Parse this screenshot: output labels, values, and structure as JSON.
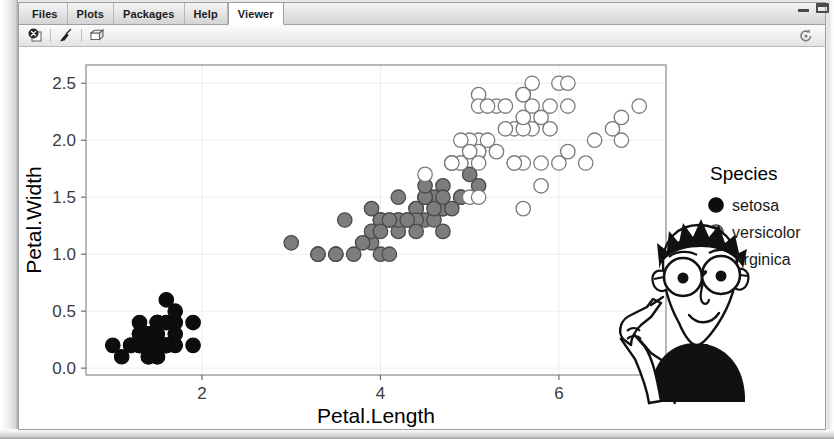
{
  "window": {
    "controls": [
      {
        "name": "minimize",
        "glyph": "minimize-icon"
      },
      {
        "name": "maximize",
        "glyph": "maximize-icon"
      }
    ]
  },
  "tabs": [
    {
      "label": "Files",
      "active": false
    },
    {
      "label": "Plots",
      "active": false
    },
    {
      "label": "Packages",
      "active": false
    },
    {
      "label": "Help",
      "active": false
    },
    {
      "label": "Viewer",
      "active": true
    }
  ],
  "toolbar": {
    "buttons": [
      {
        "name": "clear-viewer-icon",
        "title": "Back"
      },
      {
        "name": "broom-icon",
        "title": "Clear"
      },
      {
        "name": "publish-icon",
        "title": "Publish"
      }
    ],
    "refresh": {
      "name": "refresh-icon",
      "title": "Refresh"
    }
  },
  "chart_data": {
    "type": "scatter",
    "title": "",
    "xlabel": "Petal.Length",
    "ylabel": "Petal.Width",
    "xlim": [
      0.7,
      7.2
    ],
    "ylim": [
      -0.06,
      2.66
    ],
    "xticks": [
      2,
      4,
      6
    ],
    "xtick_labels": [
      "2",
      "4",
      "6"
    ],
    "yticks": [
      0.0,
      0.5,
      1.0,
      1.5,
      2.0,
      2.5
    ],
    "ytick_labels": [
      "0.0",
      "0.5",
      "1.0",
      "1.5",
      "2.0",
      "2.5"
    ],
    "grid": true,
    "legend_position": "right",
    "legend_title": "Species",
    "series": [
      {
        "name": "setosa",
        "fill": "#0d0d0d",
        "stroke": "#0d0d0d",
        "points": [
          [
            1.4,
            0.2
          ],
          [
            1.4,
            0.2
          ],
          [
            1.3,
            0.2
          ],
          [
            1.5,
            0.2
          ],
          [
            1.4,
            0.2
          ],
          [
            1.7,
            0.4
          ],
          [
            1.4,
            0.3
          ],
          [
            1.5,
            0.2
          ],
          [
            1.4,
            0.2
          ],
          [
            1.5,
            0.1
          ],
          [
            1.5,
            0.2
          ],
          [
            1.6,
            0.2
          ],
          [
            1.4,
            0.1
          ],
          [
            1.1,
            0.1
          ],
          [
            1.2,
            0.2
          ],
          [
            1.5,
            0.4
          ],
          [
            1.3,
            0.4
          ],
          [
            1.4,
            0.3
          ],
          [
            1.7,
            0.3
          ],
          [
            1.5,
            0.3
          ],
          [
            1.7,
            0.2
          ],
          [
            1.5,
            0.4
          ],
          [
            1.0,
            0.2
          ],
          [
            1.7,
            0.5
          ],
          [
            1.9,
            0.2
          ],
          [
            1.6,
            0.2
          ],
          [
            1.6,
            0.4
          ],
          [
            1.5,
            0.2
          ],
          [
            1.4,
            0.2
          ],
          [
            1.6,
            0.2
          ],
          [
            1.6,
            0.2
          ],
          [
            1.5,
            0.4
          ],
          [
            1.5,
            0.1
          ],
          [
            1.4,
            0.2
          ],
          [
            1.5,
            0.2
          ],
          [
            1.2,
            0.2
          ],
          [
            1.3,
            0.2
          ],
          [
            1.4,
            0.1
          ],
          [
            1.3,
            0.2
          ],
          [
            1.5,
            0.2
          ],
          [
            1.3,
            0.3
          ],
          [
            1.3,
            0.3
          ],
          [
            1.3,
            0.2
          ],
          [
            1.6,
            0.6
          ],
          [
            1.9,
            0.4
          ],
          [
            1.4,
            0.3
          ],
          [
            1.6,
            0.2
          ],
          [
            1.4,
            0.2
          ],
          [
            1.5,
            0.2
          ],
          [
            1.4,
            0.2
          ]
        ]
      },
      {
        "name": "versicolor",
        "fill": "#7d7d7d",
        "stroke": "#4a4a4a",
        "points": [
          [
            4.7,
            1.4
          ],
          [
            4.5,
            1.5
          ],
          [
            4.9,
            1.5
          ],
          [
            4.0,
            1.3
          ],
          [
            4.6,
            1.5
          ],
          [
            4.5,
            1.3
          ],
          [
            4.7,
            1.6
          ],
          [
            3.3,
            1.0
          ],
          [
            4.6,
            1.3
          ],
          [
            3.9,
            1.4
          ],
          [
            3.5,
            1.0
          ],
          [
            4.2,
            1.5
          ],
          [
            4.0,
            1.0
          ],
          [
            4.7,
            1.4
          ],
          [
            3.6,
            1.3
          ],
          [
            4.4,
            1.4
          ],
          [
            4.5,
            1.5
          ],
          [
            4.1,
            1.0
          ],
          [
            4.5,
            1.5
          ],
          [
            3.9,
            1.1
          ],
          [
            4.8,
            1.8
          ],
          [
            4.0,
            1.3
          ],
          [
            4.9,
            1.5
          ],
          [
            4.7,
            1.2
          ],
          [
            4.3,
            1.3
          ],
          [
            4.4,
            1.4
          ],
          [
            4.8,
            1.4
          ],
          [
            5.0,
            1.7
          ],
          [
            4.5,
            1.5
          ],
          [
            3.5,
            1.0
          ],
          [
            3.8,
            1.1
          ],
          [
            3.7,
            1.0
          ],
          [
            3.9,
            1.2
          ],
          [
            5.1,
            1.6
          ],
          [
            4.5,
            1.5
          ],
          [
            4.5,
            1.6
          ],
          [
            4.7,
            1.5
          ],
          [
            4.4,
            1.3
          ],
          [
            4.1,
            1.3
          ],
          [
            4.0,
            1.3
          ],
          [
            4.4,
            1.2
          ],
          [
            4.6,
            1.4
          ],
          [
            4.0,
            1.2
          ],
          [
            3.3,
            1.0
          ],
          [
            4.2,
            1.3
          ],
          [
            4.2,
            1.2
          ],
          [
            4.2,
            1.3
          ],
          [
            4.3,
            1.3
          ],
          [
            3.0,
            1.1
          ],
          [
            4.1,
            1.3
          ]
        ]
      },
      {
        "name": "virginica",
        "fill": "#ffffff",
        "stroke": "#7a7a7a",
        "points": [
          [
            6.0,
            2.5
          ],
          [
            5.1,
            1.9
          ],
          [
            5.9,
            2.1
          ],
          [
            5.6,
            1.8
          ],
          [
            5.8,
            2.2
          ],
          [
            6.6,
            2.1
          ],
          [
            4.5,
            1.7
          ],
          [
            6.3,
            1.8
          ],
          [
            5.8,
            1.8
          ],
          [
            6.1,
            2.5
          ],
          [
            5.1,
            2.0
          ],
          [
            5.3,
            1.9
          ],
          [
            5.5,
            2.1
          ],
          [
            5.0,
            2.0
          ],
          [
            5.1,
            2.4
          ],
          [
            5.3,
            2.3
          ],
          [
            5.5,
            1.8
          ],
          [
            6.7,
            2.2
          ],
          [
            6.9,
            2.3
          ],
          [
            5.0,
            1.5
          ],
          [
            5.7,
            2.3
          ],
          [
            4.9,
            2.0
          ],
          [
            6.7,
            2.0
          ],
          [
            4.9,
            1.8
          ],
          [
            5.7,
            2.1
          ],
          [
            6.0,
            1.8
          ],
          [
            4.8,
            1.8
          ],
          [
            4.9,
            1.8
          ],
          [
            5.6,
            2.1
          ],
          [
            5.8,
            1.6
          ],
          [
            6.1,
            1.9
          ],
          [
            6.4,
            2.0
          ],
          [
            5.6,
            2.2
          ],
          [
            5.1,
            1.5
          ],
          [
            5.6,
            1.4
          ],
          [
            6.1,
            2.3
          ],
          [
            5.6,
            2.4
          ],
          [
            5.5,
            1.8
          ],
          [
            4.8,
            1.8
          ],
          [
            5.4,
            2.1
          ],
          [
            5.6,
            2.4
          ],
          [
            5.1,
            2.3
          ],
          [
            5.1,
            1.9
          ],
          [
            5.9,
            2.3
          ],
          [
            5.7,
            2.5
          ],
          [
            5.2,
            2.3
          ],
          [
            5.0,
            1.9
          ],
          [
            5.2,
            2.0
          ],
          [
            5.4,
            2.3
          ],
          [
            5.1,
            1.8
          ]
        ]
      }
    ]
  },
  "overlay": {
    "name": "cartoon-character",
    "description": "pointing man with glasses"
  }
}
